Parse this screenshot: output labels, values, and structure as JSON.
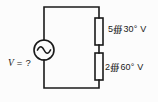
{
  "diagram": {
    "kind": "ac-series-circuit",
    "source": {
      "symbol": "ac-sine-source",
      "label_var": "V",
      "label_rest": " = ?"
    },
    "elements": [
      {
        "label": "5∰30° V"
      },
      {
        "label": "2∰60° V"
      }
    ],
    "colors": {
      "line": "#1a1a1a",
      "background": "#fcfcfc"
    }
  }
}
